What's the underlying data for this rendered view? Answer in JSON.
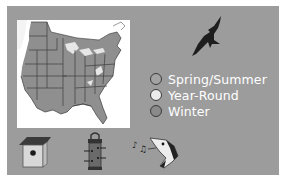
{
  "range_map": {
    "region": "Eastern United States",
    "colors": {
      "range_fill": "#8f8f8f",
      "background": "#ffffff",
      "panel": "#9c9c9c"
    }
  },
  "legend": {
    "items": [
      {
        "label": "Spring/Summer",
        "color": "#a3a3a3"
      },
      {
        "label": "Year-Round",
        "color": "#ececec"
      },
      {
        "label": "Winter",
        "color": "#8a8a8a"
      }
    ]
  },
  "icons": [
    {
      "name": "birdhouse-icon"
    },
    {
      "name": "feeder-icon"
    },
    {
      "name": "song-icon"
    }
  ]
}
